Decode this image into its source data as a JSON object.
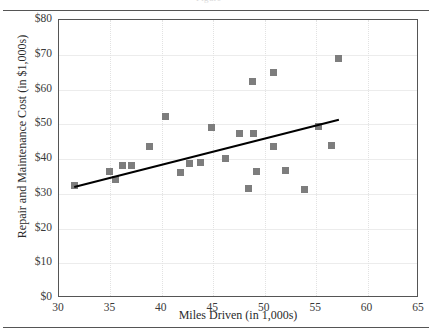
{
  "figure": {
    "header_remnant": "Figure",
    "background": "#ffffff",
    "frame_color": "#555555",
    "marker_color": "#7d7d7d",
    "trendline_color": "#000000",
    "gridline_color": "#ececec"
  },
  "chart_data": {
    "type": "scatter",
    "title": "",
    "xlabel": "Miles Driven (in 1,000s)",
    "ylabel": "Repair and Maintenance Cost (in $1,000s)",
    "xlim": [
      30,
      65
    ],
    "ylim": [
      0,
      80
    ],
    "xticks": [
      30,
      35,
      40,
      45,
      50,
      55,
      60,
      65
    ],
    "xticklabels": [
      "30",
      "35",
      "40",
      "45",
      "50",
      "55",
      "60",
      "65"
    ],
    "yticks": [
      0,
      10,
      20,
      30,
      40,
      50,
      60,
      70,
      80
    ],
    "yticklabels": [
      "$0",
      "$10",
      "$20",
      "$30",
      "$40",
      "$50",
      "$60",
      "$70",
      "$80"
    ],
    "grid": true,
    "legend": null,
    "x": [
      31.5,
      34.9,
      35.5,
      36.2,
      37.0,
      38.8,
      40.4,
      41.8,
      42.7,
      43.8,
      44.8,
      46.2,
      47.5,
      48.4,
      48.8,
      48.9,
      49.2,
      50.9,
      50.9,
      52.0,
      53.9,
      55.2,
      56.5,
      57.2
    ],
    "y": [
      32.4,
      36.3,
      34.2,
      38.1,
      38.1,
      43.7,
      52.2,
      36.0,
      38.6,
      39.0,
      49.1,
      40.2,
      47.3,
      31.4,
      62.3,
      47.4,
      36.3,
      64.9,
      43.5,
      36.7,
      31.2,
      49.4,
      44.0,
      68.8
    ],
    "trendline": {
      "x": [
        31.5,
        57.2
      ],
      "y": [
        32.2,
        51.5
      ],
      "style": "solid",
      "width": 2.4
    }
  }
}
